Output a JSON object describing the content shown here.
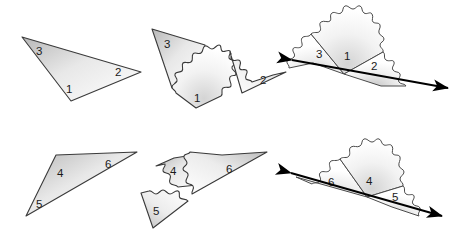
{
  "figure": {
    "background_color": "#ffffff",
    "outline_color": "#333333",
    "line_color": "#000000",
    "fill_light": "#ffffff",
    "fill_shade": "#cfcfcf",
    "label_color": "#1a1a1a"
  },
  "panels": [
    {
      "id": "row1-whole-triangle",
      "name": "Whole triangle with angles 1, 2, 3",
      "row": 1,
      "column": 1,
      "labels": [
        "3",
        "2",
        "1"
      ]
    },
    {
      "id": "row1-torn-pieces",
      "name": "Triangle torn into three pieces 1, 2, 3",
      "row": 1,
      "column": 2,
      "labels": [
        "3",
        "1",
        "2"
      ]
    },
    {
      "id": "row1-assembled-line",
      "name": "Pieces 3, 1, 2 arranged on a straight line",
      "row": 1,
      "column": 3,
      "labels": [
        "3",
        "1",
        "2"
      ]
    },
    {
      "id": "row2-whole-triangle",
      "name": "Whole triangle with angles 4, 5, 6",
      "row": 2,
      "column": 1,
      "labels": [
        "4",
        "6",
        "5"
      ]
    },
    {
      "id": "row2-torn-pieces",
      "name": "Triangle torn into three pieces 4, 5, 6",
      "row": 2,
      "column": 2,
      "labels": [
        "4",
        "6",
        "5"
      ]
    },
    {
      "id": "row2-assembled-line",
      "name": "Pieces 6, 4, 5 arranged on a straight line",
      "row": 2,
      "column": 3,
      "labels": [
        "6",
        "4",
        "5"
      ]
    }
  ],
  "angle_labels": {
    "a3": "3",
    "a2": "2",
    "a1": "1",
    "t3": "3",
    "t1": "1",
    "t2": "2",
    "l3": "3",
    "l1": "1",
    "l2": "2",
    "a4": "4",
    "a6": "6",
    "a5": "5",
    "t4": "4",
    "t6": "6",
    "t5": "5",
    "l6": "6",
    "l4": "4",
    "l5": "5"
  }
}
